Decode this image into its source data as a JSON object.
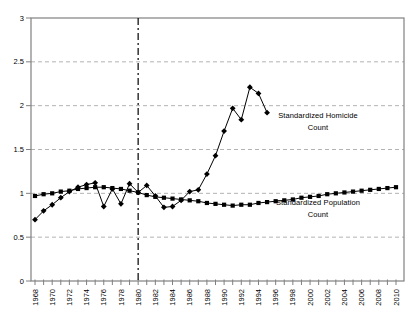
{
  "chart_data": {
    "type": "line",
    "title": "",
    "xlabel": "",
    "ylabel": "",
    "x_axis": {
      "range": [
        1968,
        2010
      ],
      "minor_tick_step": 1,
      "tick_years": [
        1968,
        1970,
        1972,
        1974,
        1976,
        1978,
        1980,
        1982,
        1984,
        1986,
        1988,
        1990,
        1992,
        1994,
        1996,
        1998,
        2000,
        2002,
        2004,
        2006,
        2008,
        2010
      ],
      "tick_labels": [
        "1968",
        "1970",
        "1972",
        "1974",
        "1976",
        "1978",
        "1980",
        "1982",
        "1984",
        "1986",
        "1988",
        "1990",
        "1992",
        "1994",
        "1996",
        "1998",
        "2000",
        "2002",
        "2004",
        "2006",
        "2008",
        "2010"
      ],
      "label_rotation_deg": -90
    },
    "y_axis": {
      "range": [
        0,
        3
      ],
      "ticks": [
        0,
        0.5,
        1,
        1.5,
        2,
        2.5,
        3
      ],
      "tick_labels": [
        "0",
        "0.5",
        "1",
        "1.5",
        "2",
        "2.5",
        "3"
      ],
      "gridlines": "dashed"
    },
    "reference_line": {
      "x": 1980,
      "style": "dash-dot",
      "color": "#000000"
    },
    "series": [
      {
        "name": "Standardized Homicide Count",
        "marker": "diamond",
        "color": "#000000",
        "years": [
          1968,
          1969,
          1970,
          1971,
          1972,
          1973,
          1974,
          1975,
          1976,
          1977,
          1978,
          1979,
          1980,
          1981,
          1982,
          1983,
          1984,
          1985,
          1986,
          1987,
          1988,
          1989,
          1990,
          1991,
          1992,
          1993,
          1994,
          1995
        ],
        "values": [
          0.7,
          0.8,
          0.87,
          0.95,
          1.02,
          1.07,
          1.1,
          1.12,
          0.85,
          1.05,
          0.88,
          1.11,
          1.01,
          1.09,
          0.97,
          0.84,
          0.85,
          0.92,
          1.02,
          1.04,
          1.22,
          1.43,
          1.71,
          1.97,
          1.84,
          2.21,
          2.14,
          1.92
        ]
      },
      {
        "name": "Standardized Population Count",
        "marker": "square",
        "color": "#000000",
        "years": [
          1968,
          1969,
          1970,
          1971,
          1972,
          1973,
          1974,
          1975,
          1976,
          1977,
          1978,
          1979,
          1980,
          1981,
          1982,
          1983,
          1984,
          1985,
          1986,
          1987,
          1988,
          1989,
          1990,
          1991,
          1992,
          1993,
          1994,
          1995,
          1996,
          1997,
          1998,
          1999,
          2000,
          2001,
          2002,
          2003,
          2004,
          2005,
          2006,
          2007,
          2008,
          2009,
          2010
        ],
        "values": [
          0.97,
          0.99,
          1.0,
          1.02,
          1.03,
          1.05,
          1.06,
          1.07,
          1.07,
          1.06,
          1.05,
          1.03,
          1.01,
          0.98,
          0.96,
          0.95,
          0.94,
          0.93,
          0.92,
          0.91,
          0.89,
          0.88,
          0.87,
          0.86,
          0.87,
          0.87,
          0.89,
          0.9,
          0.91,
          0.92,
          0.93,
          0.95,
          0.96,
          0.97,
          0.99,
          1.0,
          1.01,
          1.02,
          1.03,
          1.04,
          1.05,
          1.06,
          1.07
        ]
      }
    ],
    "annotations": [
      {
        "lines": [
          "Standardized Homicide",
          "Count"
        ]
      },
      {
        "lines": [
          "Standardized Population",
          "Count"
        ]
      }
    ],
    "legend": "none",
    "colors": {
      "grid": "#b3b3b3",
      "border": "#808080",
      "line": "#000000",
      "background": "#ffffff"
    }
  }
}
